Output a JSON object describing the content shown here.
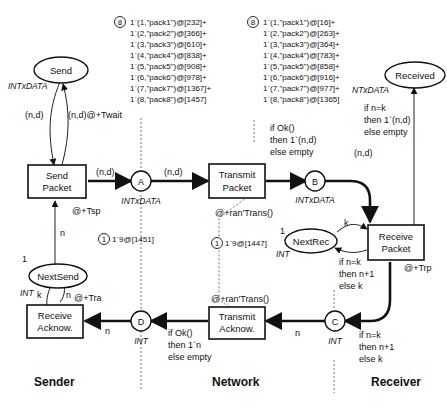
{
  "places": {
    "send": {
      "label": "Send",
      "type": "INTxDATA"
    },
    "received": {
      "label": "Received",
      "type": "NTxDATA"
    },
    "next_send": {
      "label": "NextSend",
      "type": "INT",
      "initial": "1"
    },
    "next_rec": {
      "label": "NextRec",
      "type": "INT",
      "initial": "1"
    },
    "a": {
      "label": "A",
      "type": "INTxDATA"
    },
    "b": {
      "label": "B",
      "type": "INTxDATA"
    },
    "c": {
      "label": "C",
      "type": "INT"
    },
    "d": {
      "label": "D",
      "type": "INT"
    }
  },
  "transitions": {
    "send_packet": {
      "line1": "Send",
      "line2": "Packet",
      "delay": "@+Tsp"
    },
    "transmit_packet": {
      "line1": "Transmit",
      "line2": "Packet",
      "delay": "@+ran'Trans()"
    },
    "receive_packet": {
      "line1": "Receive",
      "line2": "Packet",
      "delay": "@+Trp"
    },
    "transmit_acknow": {
      "line1": "Transmit",
      "line2": "Acknow.",
      "delay": "@+ran'Trans()"
    },
    "receive_acknow": {
      "line1": "Receive",
      "line2": "Acknow.",
      "delay": "@+Tra"
    }
  },
  "arcs": {
    "send_to_sp": "(n,d)",
    "sp_to_send": "(n,d)@+Twait",
    "sp_to_a": "(n,d)",
    "a_to_tp": "(n,d)",
    "tp_to_b": [
      "if Ok()",
      "then 1`(n,d)",
      "else empty"
    ],
    "b_to_rp": "(n,d)",
    "rp_to_received": [
      "if n=k",
      "then 1`(n,d)",
      "else empty"
    ],
    "nextsend_sp": "n",
    "nextrec_to_rp": "k",
    "rp_to_nextrec": [
      "if n=k",
      "then n+1",
      "else k"
    ],
    "rp_to_c": [
      "if n=k",
      "then n+1",
      "else k"
    ],
    "c_to_ta": "n",
    "ta_to_d": [
      "if Ok()",
      "then 1`n",
      "else empty"
    ],
    "d_to_ra": "n",
    "ra_nextsend_k": "k",
    "ra_nextsend_n": "n"
  },
  "markings": {
    "a": {
      "count": "8",
      "tokens": [
        "1`(1,\"pack1\")@[232]+",
        "1`(2,\"pack2\")@[366]+",
        "1`(3,\"pack3\")@[610]+",
        "1`(4,\"pack4\")@[838]+",
        "1`(5,\"pack5\")@[908]+",
        "1`(6,\"pack6\")@[978]+",
        "1`(7,\"pack7\")@[1367]+",
        "1`(8,\"pack8\")@[1457]"
      ]
    },
    "b": {
      "count": "8",
      "tokens": [
        "1`(1,\"pack1\")@[16]+",
        "1`(2,\"pack2\")@[263]+",
        "1`(3,\"pack3\")@[364]+",
        "1`(4,\"pack4\")@[783]+",
        "1`(5,\"pack5\")@[858]+",
        "1`(6,\"pack6\")@[916]+",
        "1`(7,\"pack7\")@[977]+",
        "1`(8,\"pack8\")@[1365]"
      ]
    },
    "d": {
      "count": "1",
      "tokens": [
        "1`9@[1451]"
      ]
    },
    "c": {
      "count": "1",
      "tokens": [
        "1`9@[1447]"
      ]
    }
  },
  "sections": {
    "sender": "Sender",
    "network": "Network",
    "receiver": "Receiver"
  }
}
